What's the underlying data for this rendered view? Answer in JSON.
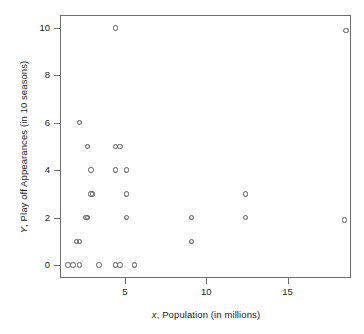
{
  "chart_data": {
    "type": "scatter",
    "title": "",
    "xlabel": "x, Population (in millions)",
    "ylabel": "Y, Play off Appearances (in 10 seasons)",
    "xlabel_italic_prefix": "x",
    "xlabel_rest": ", Population (in millions)",
    "ylabel_italic_prefix": "Y",
    "ylabel_rest": ", Play off Appearances (in 10 seasons)",
    "xlim": [
      1.0,
      18.9
    ],
    "ylim": [
      -0.55,
      10.55
    ],
    "xticks": [
      5,
      10,
      15
    ],
    "xtick_labels": [
      "5",
      "10",
      "15"
    ],
    "yticks": [
      0,
      2,
      4,
      6,
      8,
      10
    ],
    "ytick_labels": [
      "0",
      "2",
      "4",
      "6",
      "8",
      "10"
    ],
    "grid": false,
    "legend": "none",
    "marker": "open-circle",
    "marker_color": "#5a5a5a",
    "frame_color": "#6d6d6d",
    "x": [
      1.5,
      1.8,
      2.2,
      3.4,
      4.4,
      4.7,
      5.6,
      2.0,
      2.2,
      9.1,
      2.6,
      2.7,
      5.1,
      9.1,
      12.4,
      18.5,
      2.9,
      3.0,
      5.1,
      12.4,
      2.9,
      4.4,
      5.1,
      2.7,
      4.4,
      4.7,
      2.2,
      4.4,
      18.6
    ],
    "y": [
      0,
      0,
      0,
      0,
      0,
      0,
      0,
      1,
      1,
      1,
      2,
      2,
      2,
      2,
      2,
      1.9,
      3,
      3,
      3,
      3,
      4,
      4,
      4,
      5,
      5,
      5,
      6,
      10,
      9.9
    ],
    "points": [
      {
        "x": 1.5,
        "y": 0
      },
      {
        "x": 1.8,
        "y": 0
      },
      {
        "x": 2.2,
        "y": 0
      },
      {
        "x": 3.4,
        "y": 0
      },
      {
        "x": 4.4,
        "y": 0
      },
      {
        "x": 4.7,
        "y": 0
      },
      {
        "x": 5.6,
        "y": 0
      },
      {
        "x": 2.0,
        "y": 1
      },
      {
        "x": 2.2,
        "y": 1
      },
      {
        "x": 9.1,
        "y": 1
      },
      {
        "x": 2.6,
        "y": 2
      },
      {
        "x": 2.7,
        "y": 2
      },
      {
        "x": 5.1,
        "y": 2
      },
      {
        "x": 9.1,
        "y": 2
      },
      {
        "x": 12.4,
        "y": 2
      },
      {
        "x": 18.5,
        "y": 1.9
      },
      {
        "x": 2.9,
        "y": 3
      },
      {
        "x": 3.0,
        "y": 3
      },
      {
        "x": 5.1,
        "y": 3
      },
      {
        "x": 12.4,
        "y": 3
      },
      {
        "x": 2.9,
        "y": 4
      },
      {
        "x": 4.4,
        "y": 4
      },
      {
        "x": 5.1,
        "y": 4
      },
      {
        "x": 2.7,
        "y": 5
      },
      {
        "x": 4.4,
        "y": 5
      },
      {
        "x": 4.7,
        "y": 5
      },
      {
        "x": 2.2,
        "y": 6
      },
      {
        "x": 4.4,
        "y": 10
      },
      {
        "x": 18.6,
        "y": 9.9
      }
    ],
    "n_points": 29
  }
}
